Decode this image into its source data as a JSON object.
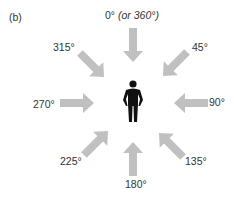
{
  "panel_label": "(b)",
  "directions": [
    {
      "angle_label": "0°",
      "extra": "(or 360°)"
    },
    {
      "angle_label": "45°"
    },
    {
      "angle_label": "90°"
    },
    {
      "angle_label": "135°"
    },
    {
      "angle_label": "180°"
    },
    {
      "angle_label": "225°"
    },
    {
      "angle_label": "270°"
    },
    {
      "angle_label": "315°"
    }
  ],
  "colors": {
    "arrow": "#c0c0c0",
    "figure": "#111111",
    "text": "#333333"
  }
}
